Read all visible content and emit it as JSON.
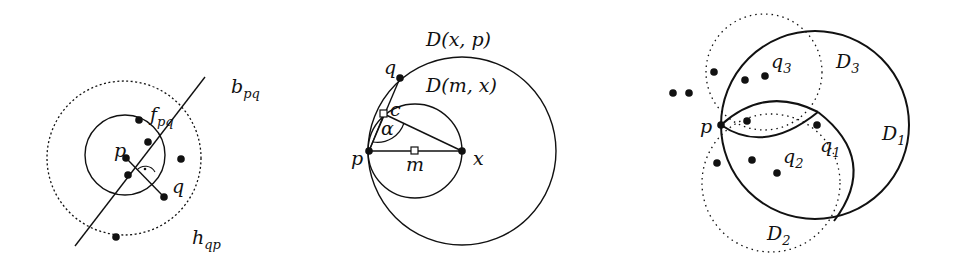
{
  "figures": [
    {
      "id": "fig-a",
      "labels": {
        "b": "b",
        "b_sub": "pq",
        "f": "f",
        "f_sub": "pq",
        "p": "p",
        "q": "q",
        "h": "h",
        "h_sub": "qp"
      }
    },
    {
      "id": "fig-b",
      "labels": {
        "Dxp": "D(x, p)",
        "Dmx": "D(m, x)",
        "q": "q",
        "c": "c",
        "alpha": "α",
        "p": "p",
        "m": "m",
        "x": "x"
      }
    },
    {
      "id": "fig-c",
      "labels": {
        "q3": "q",
        "q3_sub": "3",
        "D3": "D",
        "D3_sub": "3",
        "p": "p",
        "q1": "q",
        "q1_sub": "1",
        "D1": "D",
        "D1_sub": "1",
        "q2": "q",
        "q2_sub": "2",
        "D2": "D",
        "D2_sub": "2"
      }
    }
  ],
  "colors": {
    "stroke": "#111111",
    "background": "#ffffff"
  }
}
